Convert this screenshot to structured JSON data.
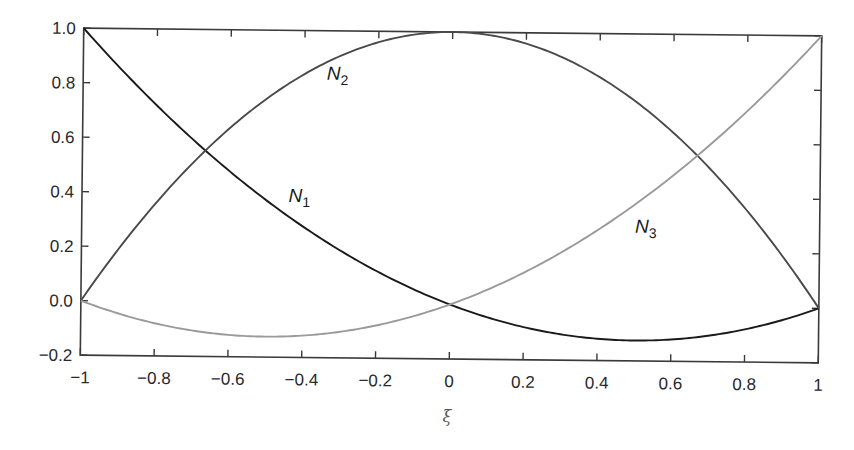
{
  "chart_data": {
    "type": "line",
    "title": "",
    "xlabel": "ξ",
    "ylabel": "",
    "xlim": [
      -1,
      1
    ],
    "ylim": [
      -0.2,
      1.0
    ],
    "grid": false,
    "legend": "none (inline curve labels)",
    "x_ticks": [
      -1,
      -0.8,
      -0.6,
      -0.4,
      -0.2,
      0,
      0.2,
      0.4,
      0.6,
      0.8,
      1
    ],
    "x_tick_labels": [
      "−1",
      "−0.8",
      "−0.6",
      "−0.4",
      "−0.2",
      "0",
      "0.2",
      "0.4",
      "0.6",
      "0.8",
      "1"
    ],
    "y_ticks": [
      -0.2,
      0.0,
      0.2,
      0.4,
      0.6,
      0.8,
      1.0
    ],
    "y_tick_labels": [
      "−0.2",
      "0.0",
      "0.2",
      "0.4",
      "0.6",
      "0.8",
      "1.0"
    ],
    "x": [
      -1,
      -0.8,
      -0.6,
      -0.4,
      -0.2,
      0,
      0.2,
      0.4,
      0.6,
      0.8,
      1
    ],
    "series": [
      {
        "name": "N1",
        "label_main": "N",
        "label_sub": "1",
        "formula": "ξ(ξ−1)/2",
        "color": "#1a1a1a",
        "values": [
          1.0,
          0.72,
          0.48,
          0.28,
          0.12,
          0.0,
          -0.08,
          -0.12,
          -0.12,
          -0.08,
          0.0
        ]
      },
      {
        "name": "N2",
        "label_main": "N",
        "label_sub": "2",
        "formula": "1−ξ²",
        "color": "#4a4a4a",
        "values": [
          0.0,
          0.36,
          0.64,
          0.84,
          0.96,
          1.0,
          0.96,
          0.84,
          0.64,
          0.36,
          0.0
        ]
      },
      {
        "name": "N3",
        "label_main": "N",
        "label_sub": "3",
        "formula": "ξ(ξ+1)/2",
        "color": "#9a9a9a",
        "values": [
          0.0,
          -0.08,
          -0.12,
          -0.12,
          -0.08,
          0.0,
          0.12,
          0.28,
          0.48,
          0.72,
          1.0
        ]
      }
    ],
    "annotations": [
      {
        "text": "N2",
        "x": -0.34,
        "y": 0.82
      },
      {
        "text": "N1",
        "x": -0.44,
        "y": 0.37
      },
      {
        "text": "N3",
        "x": 0.5,
        "y": 0.27
      }
    ]
  }
}
